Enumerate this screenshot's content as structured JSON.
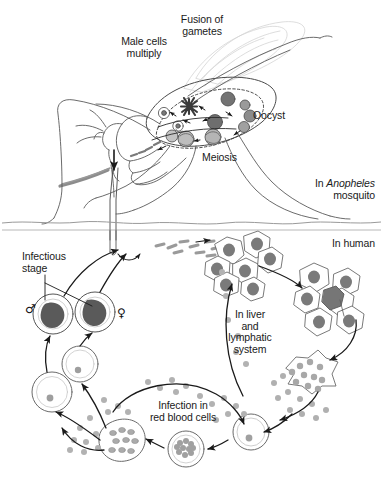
{
  "figure": {
    "background_color": "#ffffff",
    "line_color": "#4a4a4a",
    "dark_line_color": "#1a1a1a",
    "cell_fill": "#ffffff",
    "nucleus_fill": "#8c8c8c",
    "dark_blob_fill": "#595959",
    "merozoite_fill": "#a6a6a6",
    "sporozoite_fill": "#9e9e9e",
    "wing_color": "#d8d8d8"
  },
  "labels": {
    "male_cells_multiply": "Male cells\nmultiply",
    "fusion_of_gametes": "Fusion of\ngametes",
    "oocyst": "Oocyst",
    "meiosis": "Meiosis",
    "in_anopheles_prefix": "In ",
    "in_anopheles_italic": "Anopheles",
    "in_anopheles_suffix": "mosquito",
    "in_human": "In human",
    "infectious_stage": "Infectious\nstage",
    "in_liver_and_lymphatic_system": "In liver\nand\nlymphatic\nsystem",
    "infection_in_red_blood_cells": "Infection in\nred blood cells",
    "male_symbol": "♂",
    "female_symbol": "♀"
  },
  "regions": [
    {
      "name": "mosquito-region",
      "label": "In Anopheles mosquito"
    },
    {
      "name": "human-region",
      "label": "In human"
    }
  ],
  "stages": [
    {
      "name": "male-cells-multiply",
      "label": "Male cells multiply",
      "location": "mosquito midgut"
    },
    {
      "name": "fusion-of-gametes",
      "label": "Fusion of gametes",
      "location": "mosquito midgut"
    },
    {
      "name": "oocyst",
      "label": "Oocyst",
      "location": "mosquito midgut wall"
    },
    {
      "name": "meiosis",
      "label": "Meiosis",
      "location": "mosquito midgut"
    },
    {
      "name": "infectious-stage",
      "label": "Infectious stage",
      "location": "human blood, gametocytes"
    },
    {
      "name": "in-liver-and-lymphatic-system",
      "label": "In liver and lymphatic system",
      "location": "human liver"
    },
    {
      "name": "infection-in-red-blood-cells",
      "label": "Infection in red blood cells",
      "location": "human blood"
    }
  ]
}
